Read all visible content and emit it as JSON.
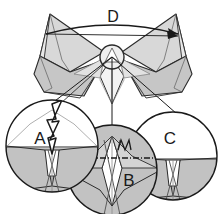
{
  "figure": {
    "background_color": "#ffffff",
    "width": 220,
    "height": 214
  },
  "colors": {
    "outline": "#2b2b2b",
    "wing_fill_light": "#d8d8d8",
    "wing_fill_mid": "#c6c6c6",
    "wing_fill_pale": "#e8e8e8",
    "detail_fill_gray": "#c2c2c2",
    "detail_fill_white": "#ffffff",
    "body_fill": "#efefef",
    "label_color": "#1a1a1a",
    "leader_line": "#2b2b2b"
  },
  "callouts": [
    {
      "id": "A",
      "label": "A",
      "kind": "magnifier-circle",
      "center_x": 52,
      "center_y": 146,
      "radius": 46,
      "label_x": 40,
      "label_y": 142,
      "marker": "lightning-bolt-arrow",
      "marker_description": "white zig-zag lightning bolt arrow with black outline pointing downward"
    },
    {
      "id": "B",
      "label": "B",
      "kind": "magnifier-circle",
      "center_x": 112,
      "center_y": 170,
      "radius": 45,
      "label_x": 128,
      "label_y": 184,
      "marker": "dash-dot-centerline",
      "marker_description": "horizontal dash-dot centre line with small squiggle above"
    },
    {
      "id": "C",
      "label": "C",
      "kind": "magnifier-circle",
      "center_x": 173,
      "center_y": 156,
      "radius": 44,
      "label_x": 168,
      "label_y": 142,
      "marker": "none",
      "marker_description": "plain magnified detail of wing-body junction"
    },
    {
      "id": "D",
      "label": "D",
      "kind": "span-arc-dimension",
      "label_x": 113,
      "label_y": 22,
      "marker": "double-headed-arc-arrow",
      "marker_description": "curved dimension arc spanning left wing tip to right wing tip with arrowheads"
    }
  ],
  "hub": {
    "name": "central-body-hub",
    "center_x": 112,
    "center_y": 57,
    "radius": 12
  },
  "leader_lines": [
    {
      "from_x": 112,
      "from_y": 57,
      "to_x": 40,
      "to_y": 113
    },
    {
      "from_x": 112,
      "from_y": 57,
      "to_x": 112,
      "to_y": 128
    },
    {
      "from_x": 112,
      "from_y": 57,
      "to_x": 176,
      "to_y": 114
    }
  ]
}
